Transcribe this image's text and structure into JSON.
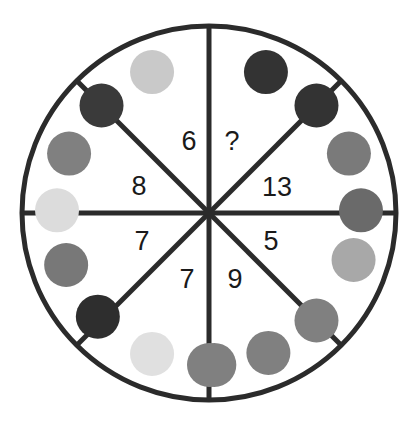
{
  "figure": {
    "background_color": "#ffffff",
    "stroke_color": "#2b2b2b",
    "text_color": "#1a1a1a"
  },
  "wheel": {
    "center_x": 209,
    "center_y": 213,
    "radius": 187,
    "stroke_width": 5,
    "sector_count": 8,
    "fill_color": "#ffffff"
  },
  "sectors": [
    {
      "id": "sector-top-right",
      "label": "?",
      "angle_start_deg": -90,
      "angle_end_deg": -45,
      "text_x": 232,
      "text_y": 143
    },
    {
      "id": "sector-right-upper",
      "label": "13",
      "angle_start_deg": -45,
      "angle_end_deg": 0,
      "text_x": 277,
      "text_y": 189
    },
    {
      "id": "sector-right-lower",
      "label": "5",
      "angle_start_deg": 0,
      "angle_end_deg": 45,
      "text_x": 271,
      "text_y": 243
    },
    {
      "id": "sector-bottom-right",
      "label": "9",
      "angle_start_deg": 45,
      "angle_end_deg": 90,
      "text_x": 235,
      "text_y": 281
    },
    {
      "id": "sector-bottom-left",
      "label": "7",
      "angle_start_deg": 90,
      "angle_end_deg": 135,
      "text_x": 187,
      "text_y": 281
    },
    {
      "id": "sector-left-lower",
      "label": "7",
      "angle_start_deg": 135,
      "angle_end_deg": 180,
      "text_x": 142,
      "text_y": 243
    },
    {
      "id": "sector-left-upper",
      "label": "8",
      "angle_start_deg": 180,
      "angle_end_deg": 225,
      "text_x": 139,
      "text_y": 188
    },
    {
      "id": "sector-top-left",
      "label": "6",
      "angle_start_deg": 225,
      "angle_end_deg": 270,
      "text_x": 189,
      "text_y": 143
    }
  ],
  "dots": {
    "radius": 22,
    "ring_radius": 152,
    "items": [
      {
        "id": "dot-1",
        "angle_deg": -112,
        "color": "#c9c9c9"
      },
      {
        "id": "dot-2",
        "angle_deg": -68,
        "color": "#333333"
      },
      {
        "id": "dot-3",
        "angle_deg": -135,
        "color": "#3a3a3a"
      },
      {
        "id": "dot-4",
        "angle_deg": -45,
        "color": "#333333"
      },
      {
        "id": "dot-5",
        "angle_deg": -157,
        "color": "#808080"
      },
      {
        "id": "dot-6",
        "angle_deg": -23,
        "color": "#7a7a7a"
      },
      {
        "id": "dot-7",
        "angle_deg": -179,
        "color": "#dcdcdc"
      },
      {
        "id": "dot-8",
        "angle_deg": -1,
        "color": "#6a6a6a"
      },
      {
        "id": "dot-9",
        "angle_deg": 18,
        "color": "#a8a8a8"
      },
      {
        "id": "dot-10",
        "angle_deg": 160,
        "color": "#787878"
      },
      {
        "id": "dot-11",
        "angle_deg": 137,
        "color": "#2e2e2e"
      },
      {
        "id": "dot-12",
        "angle_deg": 45,
        "color": "#808080"
      },
      {
        "id": "dot-13",
        "angle_deg": 112,
        "color": "#e0e0e0"
      },
      {
        "id": "dot-14",
        "angle_deg": 67,
        "color": "#808080"
      },
      {
        "id": "dot-15",
        "angle_deg": 90,
        "color": "#808080"
      },
      {
        "id": "dot-16",
        "angle_deg": 88,
        "color": "#808080"
      }
    ]
  },
  "chart_data": {
    "type": "pie",
    "categories": [
      "?",
      "13",
      "5",
      "9",
      "7",
      "7",
      "8",
      "6"
    ],
    "values": [
      45,
      45,
      45,
      45,
      45,
      45,
      45,
      45
    ],
    "labels": [
      "?",
      "13",
      "5",
      "9",
      "7",
      "7",
      "8",
      "6"
    ],
    "missing_value_marker": "?",
    "known_numbers": [
      13,
      5,
      9,
      7,
      7,
      8,
      6
    ],
    "xlabel": "",
    "ylabel": "",
    "legend": "none",
    "grid": false
  }
}
